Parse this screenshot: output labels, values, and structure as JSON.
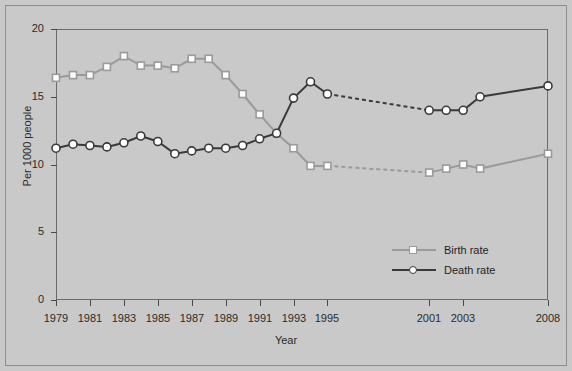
{
  "chart_data": {
    "type": "line",
    "title": "",
    "xlabel": "Year",
    "ylabel": "Per 1000 people",
    "xlim": [
      1979,
      2008
    ],
    "ylim": [
      0,
      20
    ],
    "grid": false,
    "legend_position": "inside-lower-right",
    "y_ticks": [
      0,
      5,
      10,
      15,
      20
    ],
    "x_tick_labels": [
      "1979",
      "1981",
      "1983",
      "1985",
      "1987",
      "1989",
      "1991",
      "1993",
      "1995",
      "2001",
      "2003",
      "2008"
    ],
    "x_tick_values": [
      1979,
      1981,
      1983,
      1985,
      1987,
      1989,
      1991,
      1993,
      1995,
      2001,
      2003,
      2008
    ],
    "note_gap": "Data gap between 1995 and 2001 drawn as dashed connector",
    "series": [
      {
        "name": "Birth rate",
        "color": "#9a9a9a",
        "marker": "square",
        "x": [
          1979,
          1980,
          1981,
          1982,
          1983,
          1984,
          1985,
          1986,
          1987,
          1988,
          1989,
          1990,
          1991,
          1992,
          1993,
          1994,
          1995,
          2001,
          2002,
          2003,
          2004,
          2008
        ],
        "values": [
          16.4,
          16.6,
          16.6,
          17.2,
          18.0,
          17.3,
          17.3,
          17.1,
          17.8,
          17.8,
          16.6,
          15.2,
          13.7,
          12.3,
          11.2,
          9.9,
          9.9,
          9.4,
          9.7,
          10.0,
          9.7,
          10.8
        ],
        "solid_to": 1995,
        "dashed_from": 1995,
        "dashed_to": 2001
      },
      {
        "name": "Death rate",
        "color": "#3a3a3a",
        "marker": "circle",
        "x": [
          1979,
          1980,
          1981,
          1982,
          1983,
          1984,
          1985,
          1986,
          1987,
          1988,
          1989,
          1990,
          1991,
          1992,
          1993,
          1994,
          1995,
          2001,
          2002,
          2003,
          2004,
          2008
        ],
        "values": [
          11.2,
          11.5,
          11.4,
          11.3,
          11.6,
          12.1,
          11.7,
          10.8,
          11.0,
          11.2,
          11.2,
          11.4,
          11.9,
          12.3,
          14.9,
          16.1,
          15.2,
          14.0,
          14.0,
          14.0,
          15.0,
          15.8
        ],
        "solid_to": 1995,
        "dashed_from": 1995,
        "dashed_to": 2001
      }
    ],
    "legend": [
      {
        "label": "Birth rate",
        "color": "#9a9a9a",
        "marker": "square"
      },
      {
        "label": "Death rate",
        "color": "#3a3a3a",
        "marker": "circle"
      }
    ]
  }
}
